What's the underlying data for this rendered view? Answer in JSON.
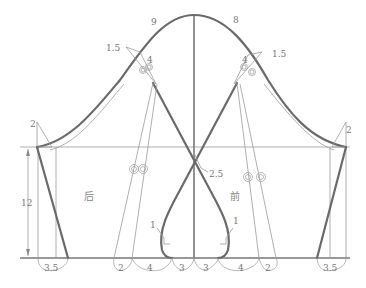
{
  "diagram": {
    "panels": {
      "back_label": "后",
      "front_label": "前"
    },
    "crown_labels": {
      "back_crown": "9",
      "front_crown": "8"
    },
    "notch_labels": {
      "back_notch_offset": "1.5",
      "back_notch_dist": "4",
      "front_notch_offset": "1.5",
      "front_notch_dist": "4"
    },
    "underarm_labels": {
      "left_raise": "2",
      "right_raise": "2"
    },
    "center_label": "2.5",
    "height_dimension": "12",
    "vent_labels": {
      "left_curve": "1",
      "right_curve": "1"
    },
    "hem_dimensions": {
      "left_edge": "3.5",
      "left_2": "2",
      "left_4": "4",
      "left_3": "3",
      "right_3": "3",
      "right_4": "4",
      "right_2": "2",
      "right_edge": "3.5"
    },
    "colors": {
      "thick_line": "#6a6a6a",
      "thin_line": "#9a9a9a",
      "label": "#777777",
      "background": "#ffffff"
    }
  }
}
